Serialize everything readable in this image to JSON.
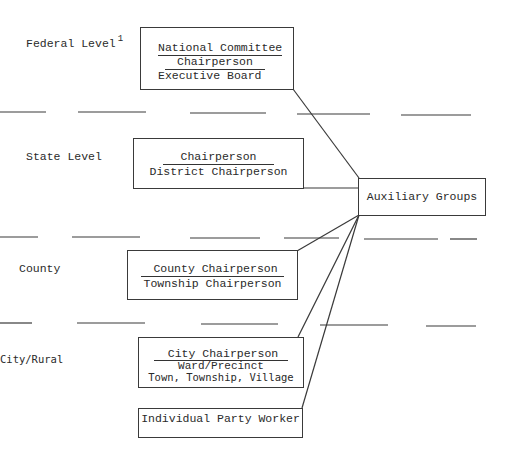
{
  "diagram": {
    "levels": [
      {
        "label": "Federal Level",
        "footnote": "1"
      },
      {
        "label": "State Level"
      },
      {
        "label": "County"
      },
      {
        "label": "City/Rural"
      }
    ],
    "boxes": {
      "federal": {
        "line1": "National Committee",
        "line2": "Chairperson",
        "line3": "Executive Board"
      },
      "state": {
        "line1": "Chairperson",
        "line2": "District Chairperson"
      },
      "auxiliary": {
        "line1": "Auxiliary Groups"
      },
      "county": {
        "line1": "County Chairperson",
        "line2": "Township Chairperson"
      },
      "city": {
        "line1": "City Chairperson",
        "line2": "Ward/Precinct",
        "line3": "Town, Township, Village"
      },
      "individual": {
        "line1": "Individual Party Worker"
      }
    },
    "connections": [
      {
        "from": "federal",
        "to": "auxiliary"
      },
      {
        "from": "state",
        "to": "auxiliary"
      },
      {
        "from": "auxiliary",
        "to": "county"
      },
      {
        "from": "auxiliary",
        "to": "city"
      },
      {
        "from": "auxiliary",
        "to": "individual"
      }
    ],
    "colors": {
      "ink": "#2a2a2a",
      "background": "#ffffff"
    }
  }
}
